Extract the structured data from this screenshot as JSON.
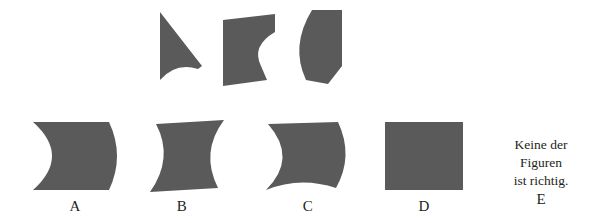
{
  "puzzle": {
    "type": "visual-reasoning-shape-assembly",
    "language": "de",
    "background_color": "#ffffff",
    "shape_fill_color": "#5a5a5a",
    "text_color": "#231f20"
  },
  "stimulus": {
    "name": "shape-pieces",
    "pieces": [
      {
        "id": "piece-1",
        "name": "narrow-wedge-piece",
        "description": "narrow wedge with vertical left edge, apex at lower right, concave bottom edge",
        "path": "M 2 2 L 44 56 L 40 59 Q 18 52 2 70 Z",
        "viewbox": "0 0 48 74",
        "left": 158,
        "top": 10,
        "width": 48,
        "height": 74
      },
      {
        "id": "piece-2",
        "name": "concave-right-block-piece",
        "description": "quadrilateral block with concave curve cut into right edge",
        "path": "M 2 8 L 54 2 L 54 20 Q 30 34 40 54 L 46 68 L 2 74 Z",
        "viewbox": "0 0 58 78",
        "left": 221,
        "top": 12,
        "width": 58,
        "height": 78
      },
      {
        "id": "piece-3",
        "name": "convex-left-bulge-piece",
        "description": "block with convex bulging left edge, angled top-left and bottom-right corners",
        "path": "M 20 2 L 50 2 L 50 58 L 36 76 L 14 72 Q -2 38 20 2 Z",
        "viewbox": "0 0 54 80",
        "left": 292,
        "top": 8,
        "width": 54,
        "height": 80
      }
    ]
  },
  "options": {
    "name": "answer-options",
    "items": [
      {
        "id": "option-a",
        "label": "A",
        "name": "option-a",
        "description": "square with deep concave bite on left edge and convex bulge on right edge",
        "path": "M 4 2 L 80 2 Q 96 36 80 70 L 4 70 Q 42 36 4 2 Z",
        "viewbox": "0 0 98 72",
        "left": 29,
        "top": 120,
        "width": 98,
        "height": 72
      },
      {
        "id": "option-b",
        "label": "B",
        "name": "option-b",
        "description": "slanted S-curve wave band with parallel curved left and right edges",
        "path": "M 22 6 L 90 2 Q 66 34 84 70 L 16 74 Q 40 40 22 6 Z",
        "viewbox": "0 0 98 78",
        "left": 134,
        "top": 118,
        "width": 98,
        "height": 78
      },
      {
        "id": "option-c",
        "label": "C",
        "name": "option-c",
        "description": "shape with concave left edge, convex right bulge and concave bottom edge",
        "path": "M 18 4 L 88 2 Q 104 36 86 68 Q 50 56 16 70 Q 48 38 18 4 Z",
        "viewbox": "0 0 106 74",
        "left": 250,
        "top": 120,
        "width": 106,
        "height": 74
      },
      {
        "id": "option-d",
        "label": "D",
        "name": "option-d",
        "description": "plain square",
        "path": "M 2 2 L 80 2 L 80 70 L 2 70 Z",
        "viewbox": "0 0 82 72",
        "left": 383,
        "top": 120,
        "width": 82,
        "height": 72
      }
    ],
    "label_positions": {
      "a": 75,
      "b": 182,
      "c": 308,
      "d": 424,
      "top": 199
    }
  },
  "none_option": {
    "name": "none-of-the-figures-option",
    "label": "E",
    "line_1": "Keine der",
    "line_2": "Figuren",
    "line_3": "ist richtig."
  }
}
